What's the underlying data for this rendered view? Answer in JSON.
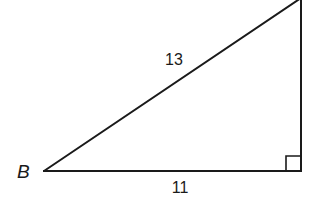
{
  "diagram": {
    "type": "right-triangle",
    "stroke_color": "#1a1a1a",
    "background": "#ffffff",
    "vertices": {
      "B": {
        "label": "B",
        "x": 44,
        "y": 171
      },
      "right_angle": {
        "label": "",
        "x": 301,
        "y": 171
      },
      "top": {
        "label": "",
        "x": 301,
        "y": -2
      }
    },
    "sides": {
      "hypotenuse": {
        "label": "13"
      },
      "base": {
        "label": "11"
      }
    },
    "right_angle_marker": {
      "size": 15
    }
  }
}
